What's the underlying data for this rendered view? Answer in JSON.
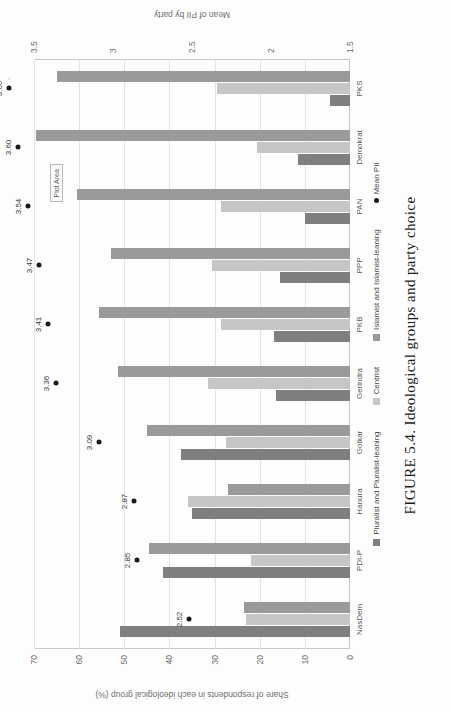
{
  "figure": {
    "caption": "FIGURE 5.4. Ideological groups and party choice"
  },
  "legend": {
    "items": [
      {
        "label": "Pluralist and Pluralist-leaning",
        "swatch": "series-0-swatch",
        "color": "#7f7f7f"
      },
      {
        "label": "Centrist",
        "swatch": "series-1-swatch",
        "color": "#c6c6c6"
      },
      {
        "label": "Islamist and Islamist-leaning",
        "swatch": "series-2-swatch",
        "color": "#9a9a9a"
      },
      {
        "label": "Mean PII",
        "swatch": "mean-pii-marker",
        "color": "#1a1a1a"
      }
    ]
  },
  "annotations": {
    "plot_area_box": "Plot Area"
  },
  "chart_data": {
    "type": "bar",
    "title": "",
    "categories": [
      "NasDem",
      "PDI-P",
      "Hanura",
      "Golkar",
      "Gerindra",
      "PKB",
      "PPP",
      "PAN",
      "Demokrat",
      "PKS"
    ],
    "series": [
      {
        "name": "Pluralist and Pluralist-leaning",
        "color": "#7f7f7f",
        "values": [
          51.0,
          41.5,
          35.0,
          37.5,
          16.5,
          16.8,
          15.5,
          10.0,
          11.5,
          4.5
        ]
      },
      {
        "name": "Centrist",
        "color": "#c6c6c6",
        "values": [
          23.0,
          22.0,
          36.0,
          27.5,
          31.5,
          28.5,
          30.5,
          28.5,
          20.5,
          29.5
        ]
      },
      {
        "name": "Islamist and Islamist-leaning",
        "color": "#9a9a9a",
        "values": [
          23.5,
          44.5,
          27.0,
          45.0,
          51.5,
          55.5,
          53.0,
          60.5,
          69.5,
          65.0
        ]
      }
    ],
    "overlay": {
      "name": "Mean PII",
      "type": "scatter",
      "color": "#1a1a1a",
      "values": [
        2.52,
        2.85,
        2.87,
        3.09,
        3.36,
        3.41,
        3.47,
        3.54,
        3.6,
        3.66
      ],
      "labels": [
        "2.52",
        "2.85",
        "2.87",
        "3.09",
        "3.36",
        "3.41",
        "3.47",
        "3.54",
        "3.60",
        "3.66"
      ]
    },
    "xlabel": "",
    "ylabel": "Share of respondents in each ideological group (%)",
    "y2label": "Mean of PII by party",
    "ylim": [
      0,
      70
    ],
    "yticks": [
      0,
      10,
      20,
      30,
      40,
      50,
      60,
      70
    ],
    "ytick_labels": [
      "0",
      "10",
      "20",
      "30",
      "40",
      "50",
      "60",
      "70"
    ],
    "y2lim": [
      1.5,
      3.5
    ],
    "y2ticks": [
      1.5,
      2,
      2.5,
      3,
      3.5
    ],
    "y2tick_labels": [
      "1.5",
      "2",
      "2.5",
      "3",
      "3.5"
    ],
    "grid": true,
    "legend_position": "bottom"
  }
}
